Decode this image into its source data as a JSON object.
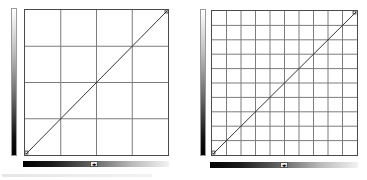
{
  "panels": [
    {
      "id": "curves-4x4",
      "grid_divisions": 4,
      "curve": "linear identity (0,0)->(255,255)",
      "slider_toggle_icon": "left-right-arrows-icon",
      "toggle_glyph": "◂▸"
    },
    {
      "id": "curves-10x10",
      "grid_divisions": 10,
      "curve": "linear identity (0,0)->(255,255)",
      "slider_toggle_icon": "left-right-arrows-icon",
      "toggle_glyph": "◂▸"
    }
  ],
  "colors": {
    "grid_line": "#7a7a7a",
    "curve": "#333333",
    "border": "#4a4a4a"
  }
}
